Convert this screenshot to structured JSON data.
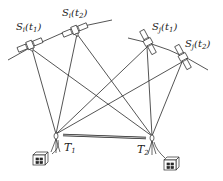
{
  "diagram": {
    "type": "satellite-geometry",
    "colors": {
      "line": "#2a2a2a",
      "background": "#ffffff"
    },
    "satellites": [
      {
        "id": "Si_t1",
        "label_main": "S",
        "label_sub": "i",
        "label_arg": "t",
        "label_arg_sub": "1",
        "x": 30,
        "y": 45,
        "orbit": "left"
      },
      {
        "id": "Si_t2",
        "label_main": "S",
        "label_sub": "i",
        "label_arg": "t",
        "label_arg_sub": "2",
        "x": 75,
        "y": 30,
        "orbit": "left"
      },
      {
        "id": "Sj_t1",
        "label_main": "S",
        "label_sub": "j",
        "label_arg": "t",
        "label_arg_sub": "1",
        "x": 148,
        "y": 42,
        "orbit": "right"
      },
      {
        "id": "Sj_t2",
        "label_main": "S",
        "label_sub": "j",
        "label_arg": "t",
        "label_arg_sub": "2",
        "x": 183,
        "y": 57,
        "orbit": "right"
      }
    ],
    "terminals": [
      {
        "id": "T1",
        "label_main": "T",
        "label_sub": "1",
        "x": 56,
        "y": 137
      },
      {
        "id": "T2",
        "label_main": "T",
        "label_sub": "2",
        "x": 152,
        "y": 139
      }
    ],
    "baseline_label": "",
    "buildings": [
      {
        "terminal": "T1",
        "x": 38,
        "y": 153
      },
      {
        "terminal": "T2",
        "x": 164,
        "y": 158
      }
    ]
  }
}
